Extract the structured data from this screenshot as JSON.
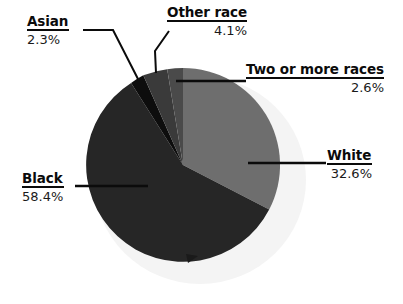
{
  "chart_data": {
    "type": "pie",
    "title": "",
    "subtitle": "",
    "xlabel": "",
    "ylabel": "",
    "legend_position": "callout-labels",
    "grid": false,
    "units": "percent",
    "total": 100.0,
    "categories": [
      "White",
      "Black",
      "Asian",
      "Other race",
      "Two or more races"
    ],
    "values": [
      32.6,
      58.4,
      2.3,
      4.1,
      2.6
    ],
    "value_labels": [
      "32.6%",
      "58.4%",
      "2.3%",
      "4.1%",
      "2.6%"
    ],
    "colors": [
      "#6e6e6e",
      "#262626",
      "#0d0d0d",
      "#3a3a3a",
      "#4a4a4a"
    ],
    "start_angle_deg": 0,
    "direction": "clockwise",
    "slices": [
      {
        "label": "White",
        "value": 32.6,
        "value_label": "32.6%",
        "color": "#6e6e6e"
      },
      {
        "label": "Black",
        "value": 58.4,
        "value_label": "58.4%",
        "color": "#262626"
      },
      {
        "label": "Asian",
        "value": 2.3,
        "value_label": "2.3%",
        "color": "#0d0d0d"
      },
      {
        "label": "Other race",
        "value": 4.1,
        "value_label": "4.1%",
        "color": "#3a3a3a"
      },
      {
        "label": "Two or more races",
        "value": 2.6,
        "value_label": "2.6%",
        "color": "#4a4a4a"
      }
    ]
  },
  "labels": {
    "asian": {
      "name": "Asian",
      "value": "2.3%"
    },
    "other": {
      "name": "Other race",
      "value": "4.1%"
    },
    "twomore": {
      "name": "Two or more races",
      "value": "2.6%"
    },
    "white": {
      "name": "White",
      "value": "32.6%"
    },
    "black": {
      "name": "Black",
      "value": "58.4%"
    }
  },
  "style": {
    "background": "#ffffff",
    "shadow_color": "#f4f4f4",
    "leader_color": "#0b0b0b",
    "text_color": "#0b0b0b"
  }
}
